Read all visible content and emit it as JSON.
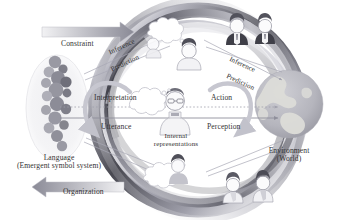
{
  "figure": {
    "type": "conceptual-diagram",
    "title_visible": false,
    "background": "#ffffff"
  },
  "labels": {
    "constraint": "Constraint",
    "organization": "Organization",
    "inference_left": "Inference",
    "prediction_left": "Prediction",
    "inference_right": "Inference",
    "prediction_right": "Prediction",
    "interpretation": "Interpretation",
    "utterance": "Utterance",
    "action": "Action",
    "perception": "Perception",
    "internal_line1": "Internal",
    "internal_line2": "representations",
    "language_line1": "Language",
    "language_line2": "(Emergent symbol system)",
    "environment_line1": "Environment",
    "environment_line2": "(World)"
  },
  "nodes": {
    "language": {
      "name": "Language (Emergent symbol system)",
      "shape": "ellipse-with-symbol-cluster",
      "symbol_count": 17
    },
    "agent": {
      "name": "Internal representations",
      "shape": "person-with-speech-bubble"
    },
    "environment": {
      "name": "Environment (World)",
      "shape": "globe"
    }
  },
  "arrows": {
    "constraint_direction": "right",
    "organization_direction": "left",
    "horizontal_top_style": "dotted",
    "horizontal_bottom_style": "solid-with-arrow"
  },
  "icons": {
    "globe": "globe-icon",
    "speech_bubble": "speech-bubble-icon",
    "person": "person-icon",
    "loop_arrow": "loop-arrow-icon",
    "gradient_arrow": "gradient-arrow-icon"
  },
  "colors": {
    "ring_dark": "#4a4a52",
    "ring_mid": "#8e8e98",
    "ring_light": "#c9c9d2",
    "globe_ocean": "#b9b9c0",
    "globe_land": "#d8d8d4",
    "symbol_circle": "#9a9aa4",
    "text": "#343434",
    "accent_line": "#9d9daa"
  },
  "people": {
    "top_count": 3,
    "bottom_count": 2,
    "center_count": 1
  }
}
